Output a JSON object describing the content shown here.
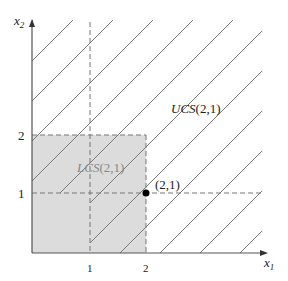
{
  "diagram": {
    "axes": {
      "x_label": "x",
      "x_sub": "1",
      "y_label": "x",
      "y_sub": "2",
      "x_ticks": [
        "1",
        "2"
      ],
      "y_ticks": [
        "1",
        "2"
      ]
    },
    "regions": {
      "upper": {
        "name": "UCS",
        "args": "(2,1)"
      },
      "lower": {
        "name": "LCS",
        "args": "(2,1)"
      }
    },
    "point": {
      "label": "(2,1)"
    },
    "colors": {
      "lower_fill": "#dcdcdc",
      "hatch": "#7a7a7a",
      "axis": "#555555",
      "dashed": "#777777",
      "point": "#000000"
    }
  }
}
